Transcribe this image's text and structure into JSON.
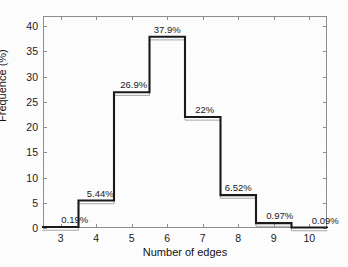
{
  "chart_data": {
    "type": "bar",
    "title": "",
    "xlabel": "Number of edges",
    "ylabel": "Frequence (%)",
    "categories": [
      "3",
      "4",
      "5",
      "6",
      "7",
      "8",
      "9",
      "10"
    ],
    "values": [
      0.19,
      5.44,
      26.9,
      37.9,
      22,
      6.52,
      0.97,
      0.09
    ],
    "data_labels": [
      "0.19%",
      "5.44%",
      "26.9%",
      "37.9%",
      "22%",
      "6.52%",
      "0.97%",
      "0.09%"
    ],
    "xlim": [
      2.5,
      10.5
    ],
    "ylim": [
      0,
      42
    ],
    "yticks": [
      "0",
      "5",
      "10",
      "15",
      "20",
      "25",
      "30",
      "35",
      "40"
    ],
    "ytick_values": [
      0,
      5,
      10,
      15,
      20,
      25,
      30,
      35,
      40
    ],
    "xticks": [
      "3",
      "4",
      "5",
      "6",
      "7",
      "8",
      "9",
      "10"
    ],
    "xtick_values": [
      3,
      4,
      5,
      6,
      7,
      8,
      9,
      10
    ],
    "grid": false,
    "legend": null,
    "bin_width": 1,
    "style": "step-outline-unfilled",
    "colors": {
      "outline": "#1a1a1a",
      "ghost_outline": "#a9a9a9",
      "axis": "#8e8e8e",
      "text": "#1a1a1a",
      "background": "#fdfdfd"
    }
  }
}
